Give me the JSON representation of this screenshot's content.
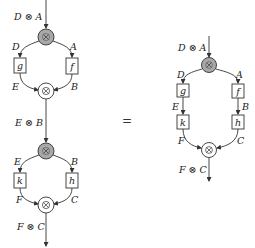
{
  "equation_sign": "=",
  "left": {
    "top_block": {
      "input_label": "D ⊗ A",
      "left_wire_top": "D",
      "right_wire_top": "A",
      "left_box": "g",
      "right_box": "f",
      "left_wire_bottom": "E",
      "right_wire_bottom": "B",
      "output_label": "E ⊗ B"
    },
    "bottom_block": {
      "left_wire_top": "E",
      "right_wire_top": "B",
      "left_box": "k",
      "right_box": "h",
      "left_wire_bottom": "F",
      "right_wire_bottom": "C",
      "output_label": "F ⊗ C"
    }
  },
  "right": {
    "input_label": "D ⊗ A",
    "left_wire_top": "D",
    "right_wire_top": "A",
    "left_box_1": "g",
    "right_box_1": "f",
    "left_wire_mid": "E",
    "right_wire_mid": "B",
    "left_box_2": "k",
    "right_box_2": "h",
    "left_wire_bottom": "F",
    "right_wire_bottom": "C",
    "output_label": "F ⊗ C"
  },
  "colors": {
    "split_node_fill": "#a8a8a8",
    "merge_node_fill": "#ffffff",
    "stroke": "#333333"
  }
}
